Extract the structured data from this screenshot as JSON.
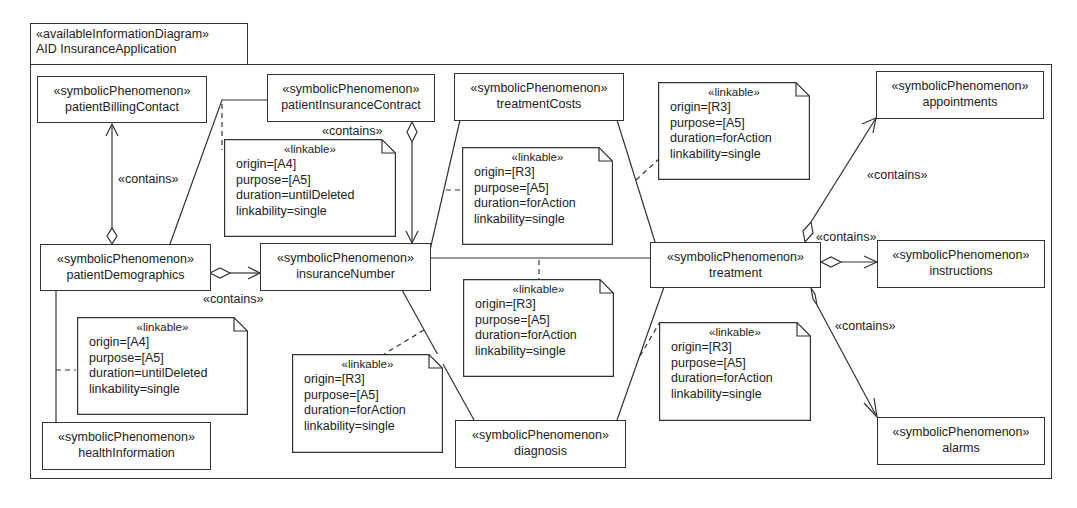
{
  "frame": {
    "stereotype": "«availableInformationDiagram»",
    "title": "AID InsuranceApplication"
  },
  "phenomena": {
    "patientBillingContact": {
      "stereotype": "«symbolicPhenomenon»",
      "name": "patientBillingContact"
    },
    "patientInsuranceContract": {
      "stereotype": "«symbolicPhenomenon»",
      "name": "patientInsuranceContract"
    },
    "treatmentCosts": {
      "stereotype": "«symbolicPhenomenon»",
      "name": "treatmentCosts"
    },
    "appointments": {
      "stereotype": "«symbolicPhenomenon»",
      "name": "appointments"
    },
    "patientDemographics": {
      "stereotype": "«symbolicPhenomenon»",
      "name": "patientDemographics"
    },
    "insuranceNumber": {
      "stereotype": "«symbolicPhenomenon»",
      "name": "insuranceNumber"
    },
    "treatment": {
      "stereotype": "«symbolicPhenomenon»",
      "name": "treatment"
    },
    "instructions": {
      "stereotype": "«symbolicPhenomenon»",
      "name": "instructions"
    },
    "healthInformation": {
      "stereotype": "«symbolicPhenomenon»",
      "name": "healthInformation"
    },
    "diagnosis": {
      "stereotype": "«symbolicPhenomenon»",
      "name": "diagnosis"
    },
    "alarms": {
      "stereotype": "«symbolicPhenomenon»",
      "name": "alarms"
    }
  },
  "notes": {
    "contractInsurance": {
      "stereotype": "«linkable»",
      "origin": "origin=[A4]",
      "purpose": "purpose=[A5]",
      "duration": "duration=untilDeleted",
      "linkability": "linkability=single"
    },
    "costsInsurance": {
      "stereotype": "«linkable»",
      "origin": "origin=[R3]",
      "purpose": "purpose=[A5]",
      "duration": "duration=forAction",
      "linkability": "linkability=single"
    },
    "costsTreatment": {
      "stereotype": "«linkable»",
      "origin": "origin=[R3]",
      "purpose": "purpose=[A5]",
      "duration": "duration=forAction",
      "linkability": "linkability=single"
    },
    "insuranceTreatment": {
      "stereotype": "«linkable»",
      "origin": "origin=[R3]",
      "purpose": "purpose=[A5]",
      "duration": "duration=forAction",
      "linkability": "linkability=single"
    },
    "demographicsHealth": {
      "stereotype": "«linkable»",
      "origin": "origin=[A4]",
      "purpose": "purpose=[A5]",
      "duration": "duration=untilDeleted",
      "linkability": "linkability=single"
    },
    "insuranceDiagnosis": {
      "stereotype": "«linkable»",
      "origin": "origin=[R3]",
      "purpose": "purpose=[A5]",
      "duration": "duration=forAction",
      "linkability": "linkability=single"
    },
    "diagnosisTreatment": {
      "stereotype": "«linkable»",
      "origin": "origin=[R3]",
      "purpose": "purpose=[A5]",
      "duration": "duration=forAction",
      "linkability": "linkability=single"
    }
  },
  "relations": {
    "contains_label": "«contains»"
  }
}
